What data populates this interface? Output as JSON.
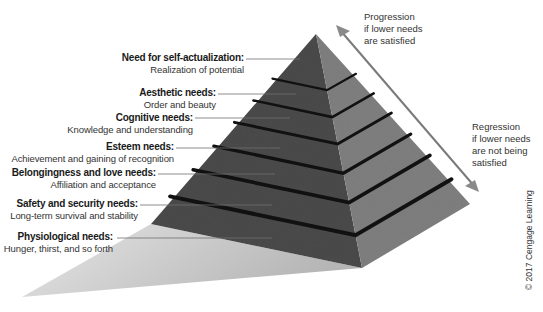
{
  "diagram": {
    "type": "hierarchy-pyramid",
    "levels": [
      {
        "title": "Need for self-actualization:",
        "desc": "Realization of potential"
      },
      {
        "title": "Aesthetic needs:",
        "desc": "Order and beauty"
      },
      {
        "title": "Cognitive needs:",
        "desc": "Knowledge and understanding"
      },
      {
        "title": "Esteem needs:",
        "desc": "Achievement and gaining of recognition"
      },
      {
        "title": "Belongingness and love needs:",
        "desc": "Affiliation and acceptance"
      },
      {
        "title": "Safety and security needs:",
        "desc": "Long-term survival and stability"
      },
      {
        "title": "Physiological needs:",
        "desc": "Hunger, thirst, and so forth"
      }
    ],
    "arrow": {
      "up_label": [
        "Progression",
        "if lower needs",
        "are satisfied"
      ],
      "down_label": [
        "Regression",
        "if lower needs",
        "are not being",
        "satisfied"
      ],
      "color": "#7a7a7a"
    },
    "copyright": "© 2017 Cengage Learning",
    "colors": {
      "left_face": "#4a4a4a",
      "right_face": "#7d7d7d",
      "gap": "#111111",
      "shadow": "#c9c9c9"
    }
  }
}
